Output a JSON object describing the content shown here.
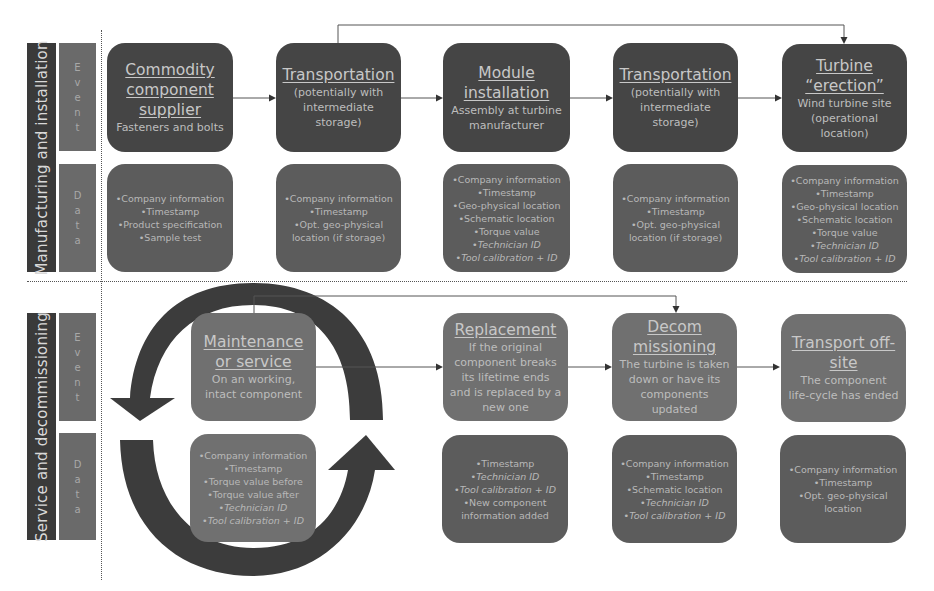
{
  "phases": [
    {
      "label": "Manufacturing and installation",
      "event_label": "Event",
      "data_label": "Data",
      "event_letters": [
        "E",
        "v",
        "e",
        "n",
        "t"
      ],
      "data_letters": [
        "D",
        "a",
        "t",
        "a"
      ],
      "stages": [
        {
          "title": "Commodity component supplier",
          "title_lines": [
            "Commodity",
            "component",
            "supplier"
          ],
          "desc_lines": [
            "Fasteners and bolts"
          ],
          "data_items": [
            {
              "text": "•Company information",
              "italic": false
            },
            {
              "text": "•Timestamp",
              "italic": false
            },
            {
              "text": "•Product specification",
              "italic": false
            },
            {
              "text": "•Sample test",
              "italic": false
            }
          ]
        },
        {
          "title": "Transportation",
          "title_lines": [
            "Transportation"
          ],
          "desc_lines": [
            "(potentially with",
            "intermediate",
            "storage)"
          ],
          "data_items": [
            {
              "text": "•Company information",
              "italic": false
            },
            {
              "text": "•Timestamp",
              "italic": false
            },
            {
              "text": "•Opt. geo-physical",
              "italic": false
            },
            {
              "text": "location (if storage)",
              "italic": false
            }
          ]
        },
        {
          "title": "Module installation",
          "title_lines": [
            "Module",
            "installation"
          ],
          "desc_lines": [
            "Assembly at turbine",
            "manufacturer"
          ],
          "data_items": [
            {
              "text": "•Company information",
              "italic": false
            },
            {
              "text": "•Timestamp",
              "italic": false
            },
            {
              "text": "•Geo-physical location",
              "italic": false
            },
            {
              "text": "•Schematic location",
              "italic": false
            },
            {
              "text": "•Torque value",
              "italic": false
            },
            {
              "text": "•Technician ID",
              "italic": true
            },
            {
              "text": "•Tool calibration + ID",
              "italic": true
            }
          ]
        },
        {
          "title": "Transportation",
          "title_lines": [
            "Transportation"
          ],
          "desc_lines": [
            "(potentially with",
            "intermediate",
            "storage)"
          ],
          "data_items": [
            {
              "text": "•Company information",
              "italic": false
            },
            {
              "text": "•Timestamp",
              "italic": false
            },
            {
              "text": "•Opt. geo-physical",
              "italic": false
            },
            {
              "text": "location (if storage)",
              "italic": false
            }
          ]
        },
        {
          "title": "Turbine “erection”",
          "title_lines": [
            "Turbine",
            "“erection”"
          ],
          "desc_lines": [
            "Wind turbine site",
            "(operational",
            "location)"
          ],
          "data_items": [
            {
              "text": "•Company information",
              "italic": false
            },
            {
              "text": "•Timestamp",
              "italic": false
            },
            {
              "text": "•Geo-physical location",
              "italic": false
            },
            {
              "text": "•Schematic location",
              "italic": false
            },
            {
              "text": "•Torque value",
              "italic": false
            },
            {
              "text": "•Technician ID",
              "italic": true
            },
            {
              "text": "•Tool calibration + ID",
              "italic": true
            }
          ]
        }
      ]
    },
    {
      "label": "Service and decommissioning",
      "event_label": "Event",
      "data_label": "Data",
      "event_letters": [
        "E",
        "v",
        "e",
        "n",
        "t"
      ],
      "data_letters": [
        "D",
        "a",
        "t",
        "a"
      ],
      "stages": [
        {
          "title": "Maintenance or service",
          "title_lines": [
            "Maintenance",
            "or service"
          ],
          "desc_lines": [
            "On an working,",
            "intact component"
          ],
          "data_items": [
            {
              "text": "•Company information",
              "italic": false
            },
            {
              "text": "•Timestamp",
              "italic": false
            },
            {
              "text": "•Torque value before",
              "italic": false
            },
            {
              "text": "•Torque value after",
              "italic": false
            },
            {
              "text": "•Technician ID",
              "italic": true
            },
            {
              "text": "•Tool calibration + ID",
              "italic": true
            }
          ]
        },
        {
          "title": "Replacement",
          "title_lines": [
            "Replacement"
          ],
          "desc_lines": [
            "If the original",
            "component breaks",
            "its lifetime ends",
            "and is replaced by a",
            "new one"
          ],
          "data_items": [
            {
              "text": "•Timestamp",
              "italic": false
            },
            {
              "text": "•Technician ID",
              "italic": true
            },
            {
              "text": "•Tool calibration + ID",
              "italic": true
            },
            {
              "text": "•New component",
              "italic": false
            },
            {
              "text": "information added",
              "italic": false
            }
          ]
        },
        {
          "title": "Decommissioning",
          "title_lines": [
            "Decom",
            "missioning"
          ],
          "desc_lines": [
            "The turbine is taken",
            "down or have its",
            "components",
            "updated"
          ],
          "data_items": [
            {
              "text": "•Company information",
              "italic": false
            },
            {
              "text": "•Timestamp",
              "italic": false
            },
            {
              "text": "•Schematic location",
              "italic": false
            },
            {
              "text": "•Technician ID",
              "italic": true
            },
            {
              "text": "•Tool calibration + ID",
              "italic": true
            }
          ]
        },
        {
          "title": "Transport off-site",
          "title_lines": [
            "Transport off-",
            "site"
          ],
          "desc_lines": [
            "The component",
            "life-cycle has ended"
          ],
          "data_items": [
            {
              "text": "•Company information",
              "italic": false
            },
            {
              "text": "•Timestamp",
              "italic": false
            },
            {
              "text": "•Opt. geo-physical",
              "italic": false
            },
            {
              "text": "location",
              "italic": false
            }
          ]
        }
      ]
    }
  ],
  "colors": {
    "phase_label_bg": "#3a3a3a",
    "row_label_bg": "#6a6a6a",
    "event_box_dark": "#454545",
    "data_box": "#5c5c5c",
    "service_box": "#707070",
    "cycle_arrow": "#3c3c3c"
  }
}
